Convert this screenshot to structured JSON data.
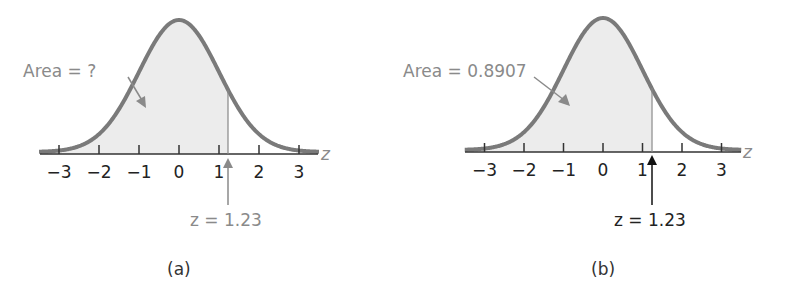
{
  "chart_data": [
    {
      "type": "area",
      "panel": "(a)",
      "title": "",
      "distribution": "standard normal",
      "xlabel": "z",
      "ylabel": "",
      "xlim": [
        -3.5,
        3.5
      ],
      "ticks": [
        -3,
        -2,
        -1,
        0,
        1,
        2,
        3
      ],
      "tick_labels": [
        "−3",
        "−2",
        "−1",
        "0",
        "1",
        "2",
        "3"
      ],
      "shaded_region": {
        "from": "-inf",
        "to": 1.23
      },
      "cutoff_z": 1.23,
      "annotations": {
        "area_label": "Area = ?",
        "z_label": "z = 1.23"
      },
      "colors": {
        "curve": "#7a7a7a",
        "shade": "#ececec",
        "annotation": "#8a8a8a",
        "arrow": "#8a8a8a"
      }
    },
    {
      "type": "area",
      "panel": "(b)",
      "title": "",
      "distribution": "standard normal",
      "xlabel": "z",
      "ylabel": "",
      "xlim": [
        -3.5,
        3.5
      ],
      "ticks": [
        -3,
        -2,
        -1,
        0,
        1,
        2,
        3
      ],
      "tick_labels": [
        "−3",
        "−2",
        "−1",
        "0",
        "1",
        "2",
        "3"
      ],
      "shaded_region": {
        "from": "-inf",
        "to": 1.23
      },
      "cutoff_z": 1.23,
      "area_value": 0.8907,
      "annotations": {
        "area_label": "Area = 0.8907",
        "z_label": "z = 1.23"
      },
      "colors": {
        "curve": "#7a7a7a",
        "shade": "#ececec",
        "annotation": "#8a8a8a",
        "arrow": "#111111"
      }
    }
  ],
  "panels": {
    "a": {
      "caption": "(a)",
      "area_label": "Area = ?",
      "z_label": "z = 1.23",
      "axis_var": "z",
      "ticks": [
        "−3",
        "−2",
        "−1",
        "0",
        "1",
        "2",
        "3"
      ]
    },
    "b": {
      "caption": "(b)",
      "area_label": "Area = 0.8907",
      "z_label": "z = 1.23",
      "axis_var": "z",
      "ticks": [
        "−3",
        "−2",
        "−1",
        "0",
        "1",
        "2",
        "3"
      ]
    }
  }
}
